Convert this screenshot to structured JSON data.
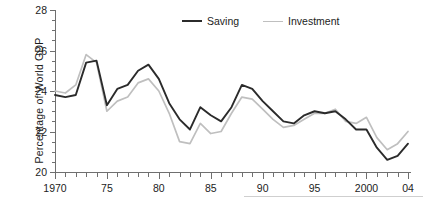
{
  "chart_data": {
    "type": "line",
    "title": "",
    "subtitle": "",
    "xlabel": "",
    "ylabel": "Percentage of  World GDP",
    "xlim": [
      1970,
      2004
    ],
    "ylim": [
      20,
      28
    ],
    "yticks": [
      20,
      22,
      24,
      26,
      28
    ],
    "ytick_labels": [
      "20",
      "22",
      "24",
      "26",
      "28"
    ],
    "ytick_minor_step": 0.5,
    "xticks": [
      1970,
      1975,
      1980,
      1985,
      1990,
      1995,
      2000,
      2004
    ],
    "xtick_labels": [
      "1970",
      "75",
      "80",
      "85",
      "90",
      "95",
      "2000",
      "04"
    ],
    "xtick_minor_step": 1,
    "grid": false,
    "legend_position": "top-center",
    "x": [
      1970,
      1971,
      1972,
      1973,
      1974,
      1975,
      1976,
      1977,
      1978,
      1979,
      1980,
      1981,
      1982,
      1983,
      1984,
      1985,
      1986,
      1987,
      1988,
      1989,
      1990,
      1991,
      1992,
      1993,
      1994,
      1995,
      1996,
      1997,
      1998,
      1999,
      2000,
      2001,
      2002,
      2003,
      2004
    ],
    "series": [
      {
        "name": "Saving",
        "color": "#2b2b2b",
        "values": [
          23.8,
          23.7,
          23.8,
          25.4,
          25.5,
          23.3,
          24.1,
          24.3,
          25.0,
          25.3,
          24.6,
          23.4,
          22.6,
          22.1,
          23.2,
          22.8,
          22.5,
          23.2,
          24.3,
          24.1,
          23.5,
          23.0,
          22.5,
          22.4,
          22.8,
          23.0,
          22.9,
          23.0,
          22.6,
          22.1,
          22.1,
          21.2,
          20.6,
          20.8,
          21.4
        ]
      },
      {
        "name": "Investment",
        "color": "#bfbfbf",
        "values": [
          24.0,
          23.9,
          24.3,
          25.8,
          25.4,
          23.0,
          23.5,
          23.7,
          24.4,
          24.6,
          24.0,
          22.9,
          21.5,
          21.4,
          22.4,
          21.9,
          22.0,
          22.9,
          23.7,
          23.6,
          23.1,
          22.6,
          22.2,
          22.3,
          22.6,
          22.9,
          22.9,
          23.1,
          22.5,
          22.4,
          22.7,
          21.7,
          21.1,
          21.4,
          22.0
        ]
      }
    ],
    "legend": [
      {
        "label": "Saving",
        "color": "#2b2b2b"
      },
      {
        "label": "Investment",
        "color": "#bfbfbf"
      }
    ]
  }
}
